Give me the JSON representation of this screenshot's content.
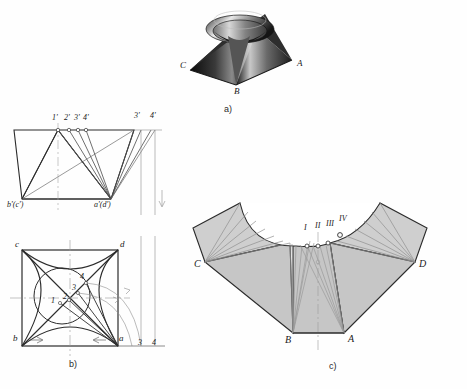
{
  "figure": {
    "captions": [
      {
        "key": "a",
        "text": "a)",
        "x": 225,
        "y": 105
      },
      {
        "key": "b",
        "text": "b)",
        "x": 71,
        "y": 360
      },
      {
        "key": "c",
        "text": "c)",
        "x": 331,
        "y": 362
      }
    ]
  },
  "pictorial": {
    "name": "pictorial-pyramid",
    "vertex_labels": [
      {
        "text": "C",
        "x": 180,
        "y": 66
      },
      {
        "text": "A",
        "x": 297,
        "y": 64
      },
      {
        "text": "B",
        "x": 236,
        "y": 86
      }
    ]
  },
  "front_view": {
    "name": "front-view",
    "labels": [
      {
        "text": "1'",
        "x": 54,
        "y": 116
      },
      {
        "text": "2'",
        "x": 67,
        "y": 116
      },
      {
        "text": "3'",
        "x": 78,
        "y": 116
      },
      {
        "text": "4'",
        "x": 87,
        "y": 116
      },
      {
        "text": "3'",
        "x": 136,
        "y": 114
      },
      {
        "text": "4'",
        "x": 152,
        "y": 114
      },
      {
        "text": "b'(c')",
        "x": 9,
        "y": 202
      },
      {
        "text": "a'(d')",
        "x": 96,
        "y": 202
      }
    ]
  },
  "top_view": {
    "name": "top-view",
    "labels": [
      {
        "text": "c",
        "x": 18,
        "y": 243
      },
      {
        "text": "d",
        "x": 120,
        "y": 243
      },
      {
        "text": "b",
        "x": 16,
        "y": 334
      },
      {
        "text": "a",
        "x": 120,
        "y": 334
      },
      {
        "text": "1",
        "x": 59,
        "y": 300
      },
      {
        "text": "2",
        "x": 70,
        "y": 297
      },
      {
        "text": "3",
        "x": 79,
        "y": 288
      },
      {
        "text": "4",
        "x": 86,
        "y": 277
      },
      {
        "text": "3",
        "x": 141,
        "y": 340
      },
      {
        "text": "4",
        "x": 155,
        "y": 340
      }
    ]
  },
  "development": {
    "name": "development-unfolded",
    "labels": [
      {
        "text": "C",
        "x": 196,
        "y": 264
      },
      {
        "text": "D",
        "x": 421,
        "y": 264
      },
      {
        "text": "B",
        "x": 277,
        "y": 336
      },
      {
        "text": "A",
        "x": 350,
        "y": 335
      },
      {
        "text": "I",
        "x": 324,
        "y": 226
      },
      {
        "text": "II",
        "x": 334,
        "y": 224
      },
      {
        "text": "III",
        "x": 345,
        "y": 222
      },
      {
        "text": "IV",
        "x": 358,
        "y": 218
      }
    ]
  },
  "colors": {
    "line": "#2b2b2b",
    "thin": "#7d7d7d",
    "fill": "#c9c9c9",
    "fill_light": "#e2e2e2",
    "axis": "#9a9a9a"
  }
}
